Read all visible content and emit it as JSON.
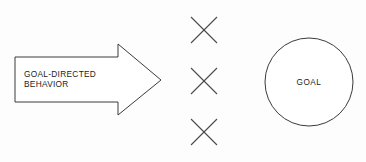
{
  "diagram": {
    "background_color": "#fdfdfd",
    "stroke_color": "#3a3a3a",
    "text_color": "#1c1c1c",
    "arrow": {
      "name": "goal-directed-behavior-arrow",
      "label_line1": "GOAL-DIRECTED",
      "label_line2": "BEHAVIOR",
      "points": "15,57 118,57 118,44 161,80 118,115 118,102 15,102",
      "label_x": 24,
      "label_y1": 77,
      "label_y2": 87
    },
    "barriers": {
      "name": "barrier-marks",
      "count": 3,
      "color": "#4a4a4a",
      "size": 26,
      "center_x": 204,
      "center_ys": [
        30,
        81,
        132
      ]
    },
    "goal": {
      "name": "goal-circle",
      "label": "GOAL",
      "cx": 309,
      "cy": 82,
      "r": 44,
      "label_x": 309,
      "label_y": 85
    }
  }
}
